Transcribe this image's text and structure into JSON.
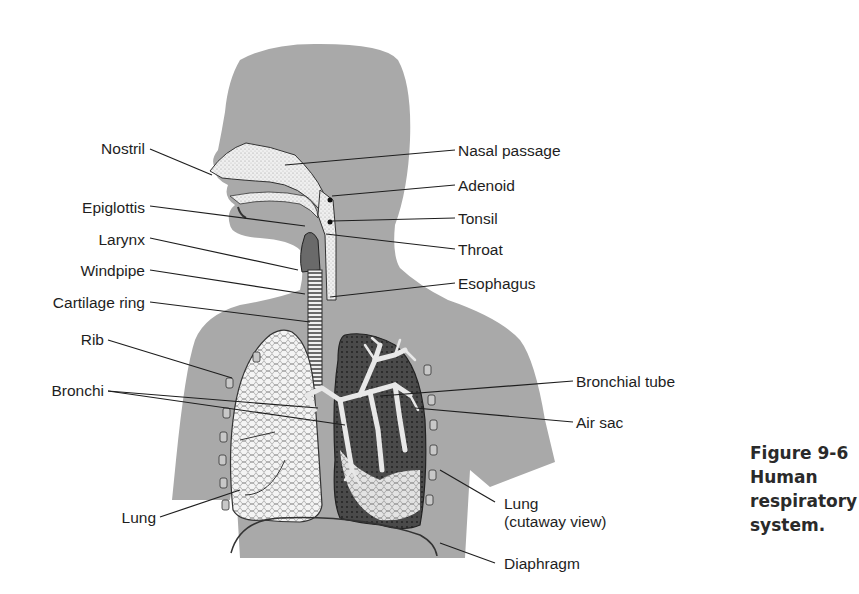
{
  "figure": {
    "caption_lines": [
      "Figure 9-6",
      "Human",
      "respiratory",
      "system."
    ],
    "colors": {
      "silhouette": "#a9a9a9",
      "lung_fill": "#e8e8e8",
      "line": "#222222"
    }
  },
  "labels_left": [
    {
      "text": "Nostril",
      "x": 145,
      "y": 140
    },
    {
      "text": "Epiglottis",
      "x": 145,
      "y": 199
    },
    {
      "text": "Larynx",
      "x": 145,
      "y": 231
    },
    {
      "text": "Windpipe",
      "x": 145,
      "y": 262
    },
    {
      "text": "Cartilage ring",
      "x": 145,
      "y": 294
    },
    {
      "text": "Rib",
      "x": 104,
      "y": 331
    },
    {
      "text": "Bronchi",
      "x": 104,
      "y": 382
    },
    {
      "text": "Lung",
      "x": 156,
      "y": 509
    }
  ],
  "labels_right": [
    {
      "text": "Nasal passage",
      "x": 458,
      "y": 142
    },
    {
      "text": "Adenoid",
      "x": 458,
      "y": 177
    },
    {
      "text": "Tonsil",
      "x": 458,
      "y": 210
    },
    {
      "text": "Throat",
      "x": 458,
      "y": 241
    },
    {
      "text": "Esophagus",
      "x": 458,
      "y": 275
    },
    {
      "text": "Bronchial tube",
      "x": 576,
      "y": 373
    },
    {
      "text": "Air sac",
      "x": 576,
      "y": 414
    },
    {
      "text": "Lung",
      "x": 504,
      "y": 495
    },
    {
      "text": "(cutaway view)",
      "x": 504,
      "y": 513
    },
    {
      "text": "Diaphragm",
      "x": 504,
      "y": 555
    }
  ]
}
